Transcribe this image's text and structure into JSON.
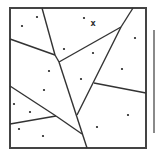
{
  "diagram": {
    "type": "voronoi",
    "colors": {
      "line": "#333333",
      "border": "#444444",
      "point": "#222222",
      "side_bar": "#8a8a8a",
      "background": "#ffffff"
    },
    "border": {
      "x": 10,
      "y": 8,
      "width": 136,
      "height": 140
    },
    "side_bar": {
      "x": 153,
      "y": 30,
      "width": 2,
      "height": 103
    },
    "edges": [
      [
        [
          42,
          8
        ],
        [
          55,
          55
        ]
      ],
      [
        [
          55,
          55
        ],
        [
          59,
          62
        ]
      ],
      [
        [
          59,
          62
        ],
        [
          87,
          148
        ]
      ],
      [
        [
          10,
          39
        ],
        [
          55,
          55
        ]
      ],
      [
        [
          59,
          62
        ],
        [
          121,
          27
        ]
      ],
      [
        [
          133,
          8
        ],
        [
          121,
          27
        ]
      ],
      [
        [
          121,
          27
        ],
        [
          77,
          115
        ]
      ],
      [
        [
          94,
          83
        ],
        [
          146,
          93
        ]
      ],
      [
        [
          10,
          86
        ],
        [
          56,
          116
        ]
      ],
      [
        [
          56,
          116
        ],
        [
          82,
          134
        ]
      ],
      [
        [
          10,
          124
        ],
        [
          56,
          116
        ]
      ]
    ],
    "sites": [
      [
        22,
        26
      ],
      [
        37,
        17
      ],
      [
        84,
        18
      ],
      [
        64,
        49
      ],
      [
        93,
        53
      ],
      [
        135,
        38
      ],
      [
        49,
        71
      ],
      [
        81,
        79
      ],
      [
        122,
        69
      ],
      [
        44,
        90
      ],
      [
        14,
        104
      ],
      [
        30,
        112
      ],
      [
        128,
        115
      ],
      [
        97,
        127
      ],
      [
        19,
        129
      ],
      [
        43,
        136
      ]
    ],
    "marker": {
      "x": 93,
      "y": 26,
      "label": "x"
    }
  }
}
